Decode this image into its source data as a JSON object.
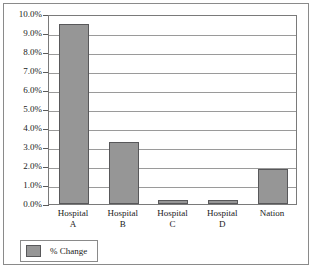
{
  "chart_data": {
    "type": "bar",
    "title": "",
    "xlabel": "",
    "ylabel": "",
    "ylim": [
      0,
      10
    ],
    "grid": true,
    "legend_position": "bottom-left",
    "categories": [
      "Hospital A",
      "Hospital B",
      "Hospital C",
      "Hospital D",
      "Nation"
    ],
    "category_lines": [
      [
        "Hospital",
        "A"
      ],
      [
        "Hospital",
        "B"
      ],
      [
        "Hospital",
        "C"
      ],
      [
        "Hospital",
        "D"
      ],
      [
        "Nation",
        ""
      ]
    ],
    "series": [
      {
        "name": "% Change",
        "color": "#969696",
        "values": [
          9.5,
          3.25,
          0.2,
          0.2,
          1.85
        ]
      }
    ],
    "y_ticks": [
      {
        "value": 10,
        "label": "10.0%"
      },
      {
        "value": 9,
        "label": "9.0%"
      },
      {
        "value": 8,
        "label": "8.0%"
      },
      {
        "value": 7,
        "label": "7.0%"
      },
      {
        "value": 6,
        "label": "6.0%"
      },
      {
        "value": 5,
        "label": "5.0%"
      },
      {
        "value": 4,
        "label": "4.0%"
      },
      {
        "value": 3,
        "label": "3.0%"
      },
      {
        "value": 2,
        "label": "2.0%"
      },
      {
        "value": 1,
        "label": "1.0%"
      },
      {
        "value": 0,
        "label": "0.0%"
      }
    ],
    "legend": [
      {
        "label": "% Change",
        "color": "#969696"
      }
    ]
  },
  "colors": {
    "bar_fill": "#969696",
    "bar_border": "#58585a",
    "gridline": "#9a9a9a",
    "axis": "#5a5a5a",
    "frame_border": "#8a8a8a",
    "text": "#1a1a1a",
    "background": "#ffffff"
  }
}
